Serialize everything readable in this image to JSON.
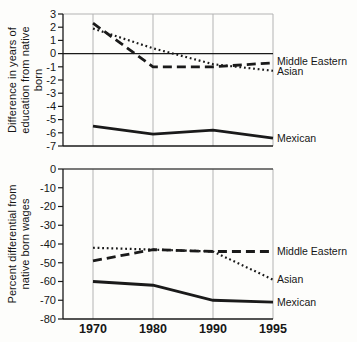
{
  "figure": {
    "background": "#fdfdfb",
    "ink": "#1a1a1a",
    "grid_color": "#b3b3b3"
  },
  "chart_data": [
    {
      "type": "line",
      "title": "",
      "categories": [
        "1970",
        "1980",
        "1990",
        "1995"
      ],
      "series": [
        {
          "name": "Middle Eastern",
          "style": "dashed",
          "values": [
            2.3,
            -1.0,
            -1.0,
            -0.7
          ]
        },
        {
          "name": "Asian",
          "style": "dotted",
          "values": [
            1.9,
            0.4,
            -0.8,
            -1.3
          ]
        },
        {
          "name": "Mexican",
          "style": "solid",
          "values": [
            -5.5,
            -6.1,
            -5.8,
            -6.4
          ]
        }
      ],
      "xlabel": "",
      "ylabel": "Difference in years of\neducation from native born",
      "ylim": [
        -7,
        3
      ],
      "ytick_step": 1,
      "zero_line": true,
      "x_labels": false,
      "grid": true,
      "legend_position": "right-of-lines"
    },
    {
      "type": "line",
      "title": "",
      "categories": [
        "1970",
        "1980",
        "1990",
        "1995"
      ],
      "series": [
        {
          "name": "Middle Eastern",
          "style": "dashed",
          "values": [
            -49,
            -43,
            -44,
            -44
          ]
        },
        {
          "name": "Asian",
          "style": "dotted",
          "values": [
            -42,
            -43,
            -44,
            -59
          ]
        },
        {
          "name": "Mexican",
          "style": "solid",
          "values": [
            -60,
            -62,
            -70,
            -71
          ]
        }
      ],
      "xlabel": "",
      "ylabel": "Percent differential from\nnative born wages",
      "ylim": [
        -80,
        0
      ],
      "ytick_step": 10,
      "zero_line": true,
      "x_labels": true,
      "grid": true,
      "legend_position": "right-of-lines"
    }
  ]
}
